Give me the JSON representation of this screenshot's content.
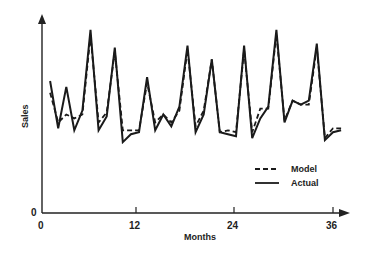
{
  "chart_data": {
    "type": "line",
    "title": "",
    "xlabel": "Months",
    "ylabel": "Sales",
    "x_ticks": [
      0,
      12,
      24,
      36
    ],
    "y_ticks": [
      0
    ],
    "xlim": [
      0,
      38
    ],
    "ylim": [
      0,
      100
    ],
    "grid": false,
    "legend_position": "lower right (inside plot)",
    "x": [
      1,
      2,
      3,
      4,
      5,
      6,
      7,
      8,
      9,
      10,
      11,
      12,
      13,
      14,
      15,
      16,
      17,
      18,
      19,
      20,
      21,
      22,
      23,
      24,
      25,
      26,
      27,
      28,
      29,
      30,
      31,
      32,
      33,
      34,
      35,
      36,
      37
    ],
    "series": [
      {
        "name": "Actual",
        "style": "solid",
        "values": [
          67,
          43,
          64,
          42,
          52,
          93,
          42,
          49,
          84,
          36,
          40,
          41,
          69,
          42,
          50,
          44,
          54,
          85,
          41,
          50,
          78,
          41,
          40,
          39,
          85,
          38,
          48,
          54,
          93,
          46,
          57,
          55,
          57,
          86,
          37,
          41,
          42
        ]
      },
      {
        "name": "Model",
        "style": "dashed",
        "values": [
          61,
          46,
          50,
          48,
          50,
          90,
          46,
          51,
          82,
          42,
          42,
          42,
          66,
          46,
          50,
          46,
          52,
          83,
          44,
          52,
          78,
          41,
          42,
          41,
          83,
          41,
          53,
          53,
          91,
          47,
          57,
          55,
          55,
          84,
          38,
          43,
          43
        ]
      }
    ],
    "legend": [
      "Model",
      "Actual"
    ]
  },
  "axes": {
    "y_origin_label": "0",
    "x_tick_labels": [
      "0",
      "12",
      "24",
      "36"
    ],
    "x_title": "Months",
    "y_title": "Sales"
  },
  "legend": {
    "items": [
      {
        "label": "Model",
        "style": "dashed"
      },
      {
        "label": "Actual",
        "style": "solid"
      }
    ]
  },
  "colors": {
    "line": "#1a1a1a",
    "background": "#ffffff"
  }
}
